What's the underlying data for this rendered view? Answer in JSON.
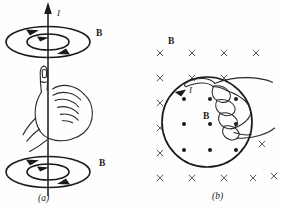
{
  "figure": {
    "kind": "physics-diagram",
    "topic": "right-hand-rule-magnetic-field",
    "background_color": "#fefefe",
    "ink_color": "#1a1a1a",
    "mark_color": "#4a4a4a",
    "width": 281,
    "height": 212
  },
  "panel_a": {
    "caption": "(a)",
    "current_label": "I",
    "field_label_top": "B",
    "field_label_bottom": "B",
    "wire": {
      "orientation": "vertical",
      "arrow_direction": "up",
      "x": 48,
      "y_top": 6,
      "y_bottom": 196
    },
    "loops": [
      {
        "name": "top-outer-ellipse",
        "cx": 48,
        "cy": 42,
        "rx": 42,
        "ry": 16,
        "arrow": "counterclockwise-viewed-from-above"
      },
      {
        "name": "top-inner-ellipse",
        "cx": 48,
        "cy": 42,
        "rx": 21,
        "ry": 8,
        "arrow": "counterclockwise-viewed-from-above"
      },
      {
        "name": "bottom-outer-ellipse",
        "cx": 48,
        "cy": 172,
        "rx": 42,
        "ry": 16,
        "arrow": "counterclockwise-viewed-from-above"
      },
      {
        "name": "bottom-inner-ellipse",
        "cx": 48,
        "cy": 172,
        "rx": 21,
        "ry": 8,
        "arrow": "counterclockwise-viewed-from-above"
      }
    ],
    "hand": {
      "description": "right fist with thumb extended upward along the wire",
      "thumb_direction": "up"
    }
  },
  "panel_b": {
    "caption": "(b)",
    "current_label": "I",
    "field_label_outside": "B",
    "field_label_inside": "B",
    "loop": {
      "name": "current-loop",
      "cx": 66,
      "cy": 122,
      "r": 45,
      "arrow": "counterclockwise",
      "arrow_angle_deg": 125
    },
    "field_into_page_symbol": "×",
    "field_out_of_page_symbol": "•",
    "crosses_outside": [
      {
        "x": 19,
        "y": 53
      },
      {
        "x": 51,
        "y": 53
      },
      {
        "x": 83,
        "y": 53
      },
      {
        "x": 115,
        "y": 53
      },
      {
        "x": 19,
        "y": 78
      },
      {
        "x": 51,
        "y": 78
      },
      {
        "x": 83,
        "y": 78
      },
      {
        "x": 19,
        "y": 103
      },
      {
        "x": 19,
        "y": 128
      },
      {
        "x": 19,
        "y": 153
      },
      {
        "x": 121,
        "y": 144
      },
      {
        "x": 19,
        "y": 178
      },
      {
        "x": 51,
        "y": 178
      },
      {
        "x": 83,
        "y": 178
      },
      {
        "x": 112,
        "y": 178
      },
      {
        "x": 133,
        "y": 176
      }
    ],
    "dots_inside": [
      {
        "x": 43,
        "y": 99
      },
      {
        "x": 69,
        "y": 99
      },
      {
        "x": 95,
        "y": 99
      },
      {
        "x": 43,
        "y": 124
      },
      {
        "x": 69,
        "y": 124
      },
      {
        "x": 95,
        "y": 124
      },
      {
        "x": 43,
        "y": 150
      },
      {
        "x": 69,
        "y": 150
      },
      {
        "x": 95,
        "y": 150
      }
    ],
    "hand": {
      "description": "right hand fingers curled around loop, thumb pointing toward viewer at upper right",
      "thumb_direction": "out-of-page"
    }
  }
}
